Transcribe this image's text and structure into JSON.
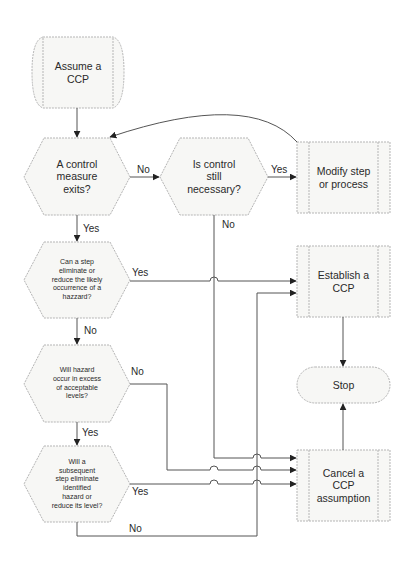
{
  "diagram": {
    "type": "flowchart",
    "colors": {
      "shape_stroke": "#b5b5b5",
      "shape_fill": "#f7f7f5",
      "line": "#555555",
      "text": "#2a2a2a"
    },
    "nodes": {
      "start": {
        "shape": "terminator-process",
        "text": "Assume a\nCCP"
      },
      "q1": {
        "shape": "hexagon",
        "text": "A control\nmeasure\nexits?"
      },
      "q2": {
        "shape": "hexagon",
        "text": "Is control\nstill\nnecessary?"
      },
      "modify": {
        "shape": "predefined-process",
        "text": "Modify step\nor process"
      },
      "q3": {
        "shape": "hexagon",
        "text": "Can a step\neliminate or\nreduce the likely\noccurrence of a\nhazzard?"
      },
      "establish": {
        "shape": "predefined-process",
        "text": "Establish a\nCCP"
      },
      "q4": {
        "shape": "hexagon",
        "text": "Will hazard\noccur in excess\nof acceptable\nlevels?"
      },
      "stop": {
        "shape": "terminator",
        "text": "Stop"
      },
      "q5": {
        "shape": "hexagon",
        "text": "Will a\nsubsequent\nstep eliminate\nidentified\nhazard or\nreduce its level?"
      },
      "cancel": {
        "shape": "predefined-process",
        "text": "Cancel a\nCCP\nassumption"
      }
    },
    "edges": [
      {
        "from": "start",
        "to": "q1",
        "label": ""
      },
      {
        "from": "q1",
        "to": "q2",
        "label": "No"
      },
      {
        "from": "q2",
        "to": "modify",
        "label": "Yes"
      },
      {
        "from": "modify",
        "to": "q1",
        "label": ""
      },
      {
        "from": "q2",
        "to": "cancel",
        "label": "No"
      },
      {
        "from": "q1",
        "to": "q3",
        "label": "Yes"
      },
      {
        "from": "q3",
        "to": "establish",
        "label": "Yes"
      },
      {
        "from": "q3",
        "to": "q4",
        "label": "No"
      },
      {
        "from": "q4",
        "to": "cancel",
        "label": "No"
      },
      {
        "from": "q4",
        "to": "q5",
        "label": "Yes"
      },
      {
        "from": "q5",
        "to": "cancel",
        "label": "Yes"
      },
      {
        "from": "q5",
        "to": "establish",
        "label": "No"
      },
      {
        "from": "establish",
        "to": "stop",
        "label": ""
      },
      {
        "from": "cancel",
        "to": "stop",
        "label": ""
      }
    ],
    "edge_labels": {
      "q1_no": "No",
      "q2_yes": "Yes",
      "q2_no": "No",
      "q1_yes": "Yes",
      "q3_yes": "Yes",
      "q3_no": "No",
      "q4_no": "No",
      "q4_yes": "Yes",
      "q5_yes": "Yes",
      "q5_no": "No"
    }
  }
}
